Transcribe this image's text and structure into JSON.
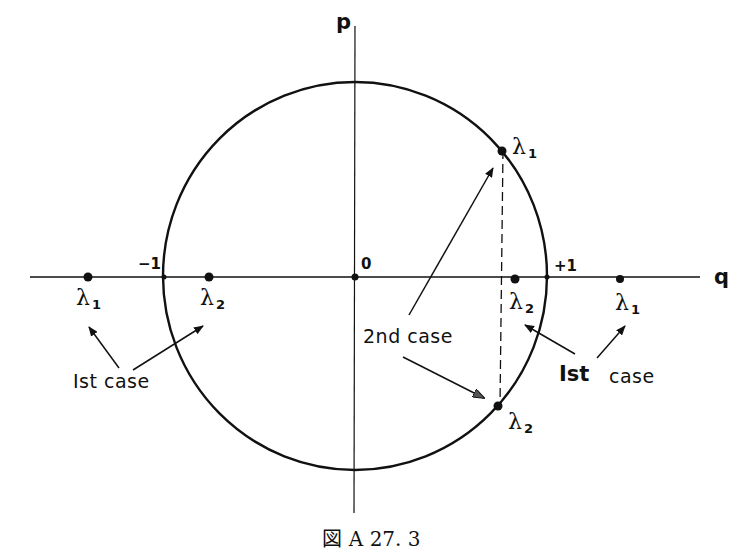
{
  "figure": {
    "caption": "図 A 27. 3",
    "axes": {
      "x_label": "q",
      "y_label": "p",
      "origin_label": "0",
      "minus_one_label": "−1",
      "plus_one_label": "+1"
    },
    "unit_circle": {
      "center_px": [
        355,
        276
      ],
      "radius_px": [
        192,
        194
      ]
    },
    "points": [
      {
        "id": "first-case-left-lambda1",
        "label": "λ",
        "sub": "1",
        "case": "1st case",
        "q_approx": -1.38,
        "p": 0
      },
      {
        "id": "first-case-left-lambda2",
        "label": "λ",
        "sub": "2",
        "case": "1st case",
        "q_approx": -0.76,
        "p": 0
      },
      {
        "id": "first-case-right-lambda2",
        "label": "λ",
        "sub": "2",
        "case": "1st case",
        "q_approx": 0.82,
        "p": 0
      },
      {
        "id": "first-case-right-lambda1",
        "label": "λ",
        "sub": "1",
        "case": "1st case",
        "q_approx": 1.41,
        "p": 0
      },
      {
        "id": "second-case-lambda1",
        "label": "λ",
        "sub": "1",
        "case": "2nd case",
        "q_approx": 0.75,
        "p_approx": 0.66
      },
      {
        "id": "second-case-lambda2",
        "label": "λ",
        "sub": "2",
        "case": "2nd case",
        "q_approx": 0.75,
        "p_approx": -0.66
      }
    ],
    "annotations": {
      "first_case_left": "Ist case",
      "first_case_right_a": "Ist",
      "first_case_right_b": "case",
      "second_case": "2nd case"
    },
    "colors": {
      "ink": "#111111",
      "background": "#ffffff"
    }
  }
}
